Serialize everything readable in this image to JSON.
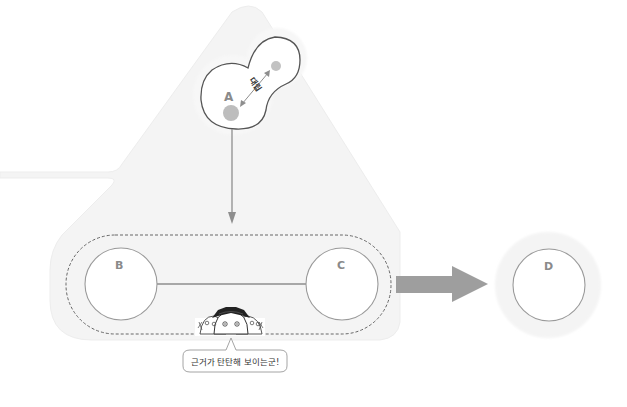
{
  "diagram": {
    "colors": {
      "background": "#ffffff",
      "panel_fill": "#f3f3f3",
      "panel_edge": "#ececec",
      "stroke": "#8e8e8e",
      "cell_outline": "#555555",
      "dot_fill": "#bdbdbd",
      "big_arrow": "#9e9e9e",
      "label": "#8a8a8a",
      "hat": "#222222"
    },
    "nodes": {
      "a": {
        "label": "A"
      },
      "b": {
        "label": "B"
      },
      "c": {
        "label": "C"
      },
      "d": {
        "label": "D"
      }
    },
    "opposition_label": "대립",
    "speech_bubble": {
      "text": "근거가 탄탄해 보이는군!"
    },
    "characters_icon": "three-students-peeking-icon"
  }
}
